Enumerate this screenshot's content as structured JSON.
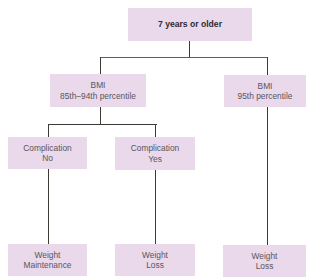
{
  "diagram": {
    "type": "decision-tree",
    "colors": {
      "node_fill": "#e9d9ea",
      "node_text": "#5a5560",
      "root_text": "#2e2a30",
      "connector": "#3c3b36"
    },
    "root": {
      "label": "7 years or older"
    },
    "level1": [
      {
        "line1": "BMI",
        "line2": "85th–94th percentile"
      },
      {
        "line1": "BMI",
        "line2": "95th percentile"
      }
    ],
    "level2": [
      {
        "line1": "Complication",
        "line2": "No"
      },
      {
        "line1": "Complication",
        "line2": "Yes"
      }
    ],
    "outcomes": [
      {
        "line1": "Weight",
        "line2": "Maintenance"
      },
      {
        "line1": "Weight",
        "line2": "Loss"
      },
      {
        "line1": "Weight",
        "line2": "Loss"
      }
    ],
    "edges": [
      {
        "from": "7 years or older",
        "to": "BMI 85th–94th percentile"
      },
      {
        "from": "7 years or older",
        "to": "BMI 95th percentile"
      },
      {
        "from": "BMI 85th–94th percentile",
        "to": "Complication No"
      },
      {
        "from": "BMI 85th–94th percentile",
        "to": "Complication Yes"
      },
      {
        "from": "Complication No",
        "to": "Weight Maintenance"
      },
      {
        "from": "Complication Yes",
        "to": "Weight Loss"
      },
      {
        "from": "BMI 95th percentile",
        "to": "Weight Loss"
      }
    ]
  }
}
